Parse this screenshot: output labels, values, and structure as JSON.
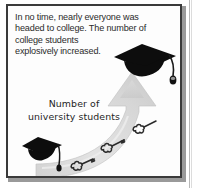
{
  "illustration": {
    "title": "College enrollment growth cartoon",
    "body_text": {
      "line1": "In no time, nearly everyone was",
      "line2": "headed to college. The number of",
      "line3": "college students",
      "line4": "explosively increased."
    },
    "caption": {
      "line1": "Number of",
      "line2": "university students"
    },
    "icons": {
      "cap_top": "graduation-cap-icon",
      "cap_bottom": "graduation-cap-icon",
      "arrow": "upward-curved-arrow-icon",
      "puffs": "dust-puff-icon"
    },
    "colors": {
      "ink": "#2b2b2b",
      "frame_border": "#3a3a3a",
      "frame_shadow": "#9a9a9a",
      "arrow_light": "#e4e4e4",
      "arrow_dark": "#bdbdbd",
      "cap_fill": "#0d0d0d",
      "paper": "#fdfdfd"
    }
  }
}
